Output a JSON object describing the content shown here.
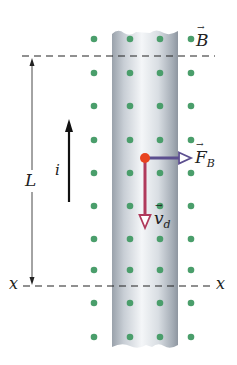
{
  "diagram": {
    "labels": {
      "magnetic_field": "B",
      "length": "L",
      "current": "i",
      "force": "F",
      "force_sub": "B",
      "drift_velocity": "v",
      "drift_velocity_sub": "d",
      "x_left": "x",
      "x_right": "x"
    },
    "colors": {
      "field_dot": "#4a9e6b",
      "wire_light": "#f2f4f6",
      "wire_dark": "#9aa2ab",
      "charge": "#e8431f",
      "force_arrow": "#5c4f8f",
      "velocity_arrow": "#b03a5c",
      "line": "#222222"
    },
    "field_dots": {
      "columns_x": [
        94,
        130,
        160,
        191
      ],
      "rows_y": [
        39,
        73,
        106,
        140,
        173,
        206,
        239,
        270,
        303,
        337
      ]
    }
  }
}
